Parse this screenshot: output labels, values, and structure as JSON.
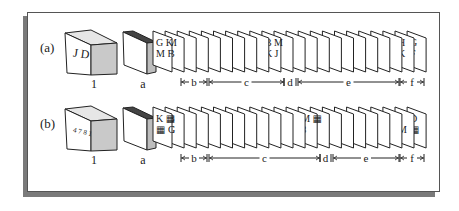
{
  "figure": {
    "colors": {
      "line": "#222222",
      "shadow": "#7a7a7a",
      "box_side": "#c9c9c9",
      "deck_side": "#bdbdbd",
      "frame_border": "#555555",
      "background": "#ffffff"
    },
    "rows": [
      {
        "label": "(a)",
        "box_text": "J D",
        "box_label": "1",
        "deck_label": "a",
        "labeled_cards": [
          {
            "index": 0,
            "lines": [
              "G K",
              "M F"
            ]
          },
          {
            "index": 1,
            "lines": [
              "M",
              "B"
            ]
          },
          {
            "index": 9,
            "lines": [
              "B M",
              "K J"
            ]
          },
          {
            "index": 20,
            "lines": [
              "H",
              "K"
            ]
          },
          {
            "index": 21,
            "lines": [
              "G",
              "F"
            ]
          }
        ],
        "segments": [
          {
            "label": "b",
            "from": 181,
            "to": 207
          },
          {
            "label": "c",
            "from": 209,
            "to": 284
          },
          {
            "label": "d",
            "from": 284,
            "to": 296
          },
          {
            "label": "e",
            "from": 298,
            "to": 399
          },
          {
            "label": "f",
            "from": 400,
            "to": 424
          }
        ]
      },
      {
        "label": "(b)",
        "box_text": "4 7 8 1",
        "box_label": "1",
        "deck_label": "a",
        "labeled_cards": [
          {
            "index": 0,
            "lines": [
              "K ▦",
              "▦ G"
            ]
          },
          {
            "index": 1,
            "lines": [
              "B",
              "C"
            ]
          },
          {
            "index": 12,
            "lines": [
              "M ▦",
              "8"
            ]
          },
          {
            "index": 20,
            "lines": [
              "J",
              "M"
            ]
          },
          {
            "index": 21,
            "lines": [
              "D",
              "▦"
            ]
          }
        ],
        "segments": [
          {
            "label": "b",
            "from": 181,
            "to": 207
          },
          {
            "label": "c",
            "from": 209,
            "to": 320
          },
          {
            "label": "d",
            "from": 320,
            "to": 331
          },
          {
            "label": "e",
            "from": 333,
            "to": 399
          },
          {
            "label": "f",
            "from": 400,
            "to": 424
          }
        ]
      }
    ]
  }
}
